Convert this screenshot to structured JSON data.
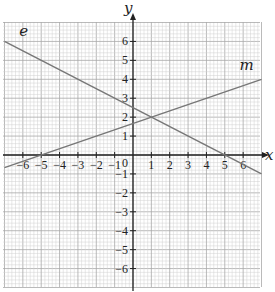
{
  "chart_data": {
    "type": "line",
    "title": "",
    "xlabel": "x",
    "ylabel": "y",
    "xlim": [
      -7,
      7
    ],
    "ylim": [
      -7,
      7
    ],
    "grid": true,
    "x_ticks": [
      -6,
      -5,
      -4,
      -3,
      -2,
      -1,
      0,
      1,
      2,
      3,
      4,
      5,
      6
    ],
    "y_ticks": [
      -6,
      -5,
      -4,
      -3,
      -2,
      -1,
      1,
      2,
      3,
      4,
      5,
      6
    ],
    "origin_label": "0",
    "series": [
      {
        "name": "e",
        "equation": "y = -0.5x + 2.5",
        "slope": -0.5,
        "intercept": 2.5,
        "points": [
          [
            -7,
            6
          ],
          [
            -6,
            5.5
          ],
          [
            1,
            2
          ],
          [
            5,
            0
          ],
          [
            7,
            -1
          ]
        ]
      },
      {
        "name": "m",
        "equation": "y = x/3 + 5/3",
        "slope": 0.3333,
        "intercept": 1.6667,
        "points": [
          [
            -7,
            -0.667
          ],
          [
            -5,
            0
          ],
          [
            1,
            2
          ],
          [
            7,
            4
          ]
        ]
      }
    ],
    "annotations": [
      {
        "text": "e",
        "x": -6.2,
        "y": 6.3
      },
      {
        "text": "m",
        "x": 5.8,
        "y": 4.5
      },
      {
        "text": "intersection",
        "x": 1,
        "y": 2
      }
    ]
  },
  "colors": {
    "grid_minor": "#d0d0d0",
    "grid_major": "#a8a8a8",
    "axis": "#222222",
    "line": "#777777"
  }
}
